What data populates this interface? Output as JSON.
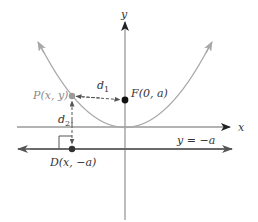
{
  "diagram": {
    "labels": {
      "y_axis": "y",
      "x_axis": "x",
      "focus": "F(0, a)",
      "point": "P(x, y)",
      "directrix_point": "D(x, −a)",
      "directrix": "y = −a",
      "d1": "d",
      "d1_sub": "1",
      "d2": "d",
      "d2_sub": "2"
    },
    "colors": {
      "axis": "#9a9a9a",
      "axis_arrow": "#222222",
      "parabola": "#a8a8a8",
      "directrix": "#6a6a6a",
      "point_focus": "#111111",
      "point_p": "#9a9a9a",
      "point_d": "#333333",
      "dashed": "#555555"
    },
    "geometry": {
      "origin": [
        125,
        127
      ],
      "focus": [
        125,
        100
      ],
      "point_p": [
        72,
        96
      ],
      "point_d": [
        72,
        149
      ],
      "directrix_y": 149,
      "parabola_left_tip": [
        38,
        42
      ],
      "parabola_right_tip": [
        212,
        42
      ]
    }
  }
}
